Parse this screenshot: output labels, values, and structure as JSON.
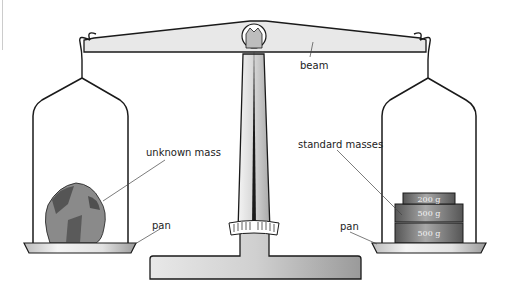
{
  "diagram": {
    "labels": {
      "beam": "beam",
      "unknown_mass": "unknown mass",
      "standard_masses": "standard masses",
      "pan_left": "pan",
      "pan_right": "pan"
    },
    "weights": [
      {
        "label": "200 g"
      },
      {
        "label": "500 g"
      },
      {
        "label": "500 g"
      }
    ],
    "colors": {
      "outline": "#1a1a1a",
      "metal_light": "#e6e6e6",
      "metal_mid": "#bdbdbd",
      "rock": "#6e6e6e",
      "weights": "#7a7a7a"
    }
  }
}
